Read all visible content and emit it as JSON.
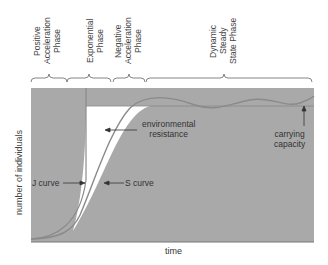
{
  "diagram": {
    "phases": [
      {
        "label": "Positive\nAcceleration\nPhase"
      },
      {
        "label": "Exponential\nPhase"
      },
      {
        "label": "Negative\nAcceleration\nPhase"
      },
      {
        "label": "Dynamic\nSteady\nState Phase"
      }
    ],
    "annotations": {
      "environmental_resistance": "environmental\nresistance",
      "carrying_capacity": "carrying\ncapacity",
      "j_curve": "J curve",
      "s_curve": "S curve"
    },
    "axes": {
      "y_label": "number of individuals",
      "x_label": "time"
    },
    "colors": {
      "background": "#a9a9a9",
      "curve": "#8a8a8a",
      "resistance_area": "#ffffff"
    }
  }
}
